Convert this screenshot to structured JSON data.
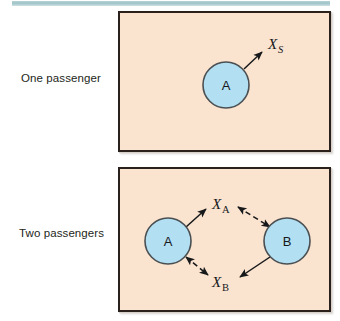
{
  "figure": {
    "background_color": "#ffffff",
    "rule_color": "#9fc4c8",
    "panel_fill": "#fae3cf",
    "panel_border_color": "#2a211c",
    "circle_fill": "#b3dff2",
    "circle_stroke": "#4a4f52",
    "arrow_color": "#16181a"
  },
  "rows": [
    {
      "label": "One passenger",
      "panel": {
        "circles": [
          {
            "letter": "A",
            "cx": 106,
            "cy": 72,
            "r": 23
          }
        ],
        "vectors": [
          {
            "base": "X",
            "subscript": "S",
            "subscript_style": "italic",
            "line_style": "solid",
            "heads": "single",
            "from": "A",
            "to": "X_S",
            "label_x": 146,
            "label_y": 34
          }
        ]
      }
    },
    {
      "label": "Two passengers",
      "panel": {
        "circles": [
          {
            "letter": "A",
            "cx": 48,
            "cy": 72,
            "r": 23
          },
          {
            "letter": "B",
            "cx": 167,
            "cy": 72,
            "r": 23
          }
        ],
        "vectors": [
          {
            "base": "X",
            "subscript": "A",
            "subscript_style": "upright",
            "line_style": "solid",
            "heads": "single",
            "from": "A",
            "to": "X_A",
            "label_x": 92,
            "label_y": 40
          },
          {
            "base": "X",
            "subscript": "A",
            "subscript_style": "upright",
            "line_style": "dashed",
            "heads": "double",
            "from": "B",
            "to": "X_A",
            "label_x": 92,
            "label_y": 40
          },
          {
            "base": "X",
            "subscript": "B",
            "subscript_style": "upright",
            "line_style": "dashed",
            "heads": "double",
            "from": "A",
            "to": "X_B",
            "label_x": 92,
            "label_y": 114
          },
          {
            "base": "X",
            "subscript": "B",
            "subscript_style": "upright",
            "line_style": "solid",
            "heads": "single",
            "from": "B",
            "to": "X_B",
            "label_x": 92,
            "label_y": 114
          }
        ]
      }
    }
  ]
}
